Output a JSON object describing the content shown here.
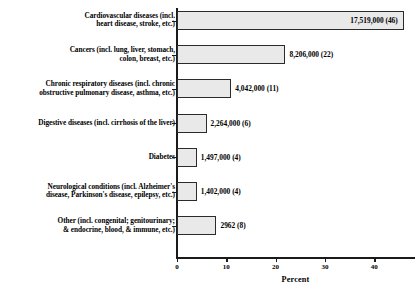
{
  "chart_data": {
    "type": "bar",
    "orientation": "horizontal",
    "title": "",
    "xlabel": "Percent",
    "ylabel": "",
    "xlim": [
      0,
      48.5
    ],
    "xticks": [
      0,
      10,
      20,
      30,
      40
    ],
    "xtick_labels": [
      "0",
      "10",
      "20",
      "30",
      "40"
    ],
    "grid": false,
    "legend": null,
    "categories": [
      "Cardiovascular diseases (incl. heart disease, stroke,  etc.)",
      "Cancers (incl. lung, liver, stomach, colon, breast, etc.)",
      "Chronic respiratory diseases (incl. chronic obstructive pulmonary disease, asthma, etc.)",
      "Digestive diseases (incl. cirrhosis of the liver)",
      "Diabetes",
      "Neurological conditions (incl. Alzheimer's disease, Parkinson's disease, epilepsy, etc.)",
      "Other (incl. congenital; genitourinary; & endocrine, blood, & immune, etc.)"
    ],
    "values": [
      46,
      22,
      11,
      6,
      4,
      4,
      8
    ],
    "counts": [
      17519000,
      8206000,
      4042000,
      2264000,
      1497000,
      1402000,
      2962
    ],
    "data_labels": [
      "17,519,000 (46)",
      "8,206,000 (22)",
      "4,042,000 (11)",
      "2,264,000 (6)",
      "1,497,000 (4)",
      "1,402,000 (4)",
      "2962 (8)"
    ]
  },
  "rows": [
    {
      "label_lines": [
        "Cardiovascular diseases (incl.",
        "heart disease, stroke,  etc.)"
      ],
      "value_label": "17,519,000 (46)",
      "percent": 46,
      "label_inside": true
    },
    {
      "label_lines": [
        "Cancers (incl. lung, liver, stomach,",
        "colon, breast, etc.)"
      ],
      "value_label": "8,206,000 (22)",
      "percent": 22,
      "label_inside": false
    },
    {
      "label_lines": [
        "Chronic respiratory diseases (incl. chronic",
        "obstructive pulmonary disease, asthma, etc.)"
      ],
      "value_label": "4,042,000 (11)",
      "percent": 11,
      "label_inside": false
    },
    {
      "label_lines": [
        "Digestive diseases (incl. cirrhosis of the liver)"
      ],
      "value_label": "2,264,000 (6)",
      "percent": 6,
      "label_inside": false
    },
    {
      "label_lines": [
        "Diabetes"
      ],
      "value_label": "1,497,000 (4)",
      "percent": 4,
      "label_inside": false
    },
    {
      "label_lines": [
        "Neurological conditions (incl. Alzheimer's",
        "disease, Parkinson's disease, epilepsy, etc.)"
      ],
      "value_label": "1,402,000 (4)",
      "percent": 4,
      "label_inside": false
    },
    {
      "label_lines": [
        "Other (incl. congenital; genitourinary;",
        "& endocrine, blood, & immune, etc.)"
      ],
      "value_label": "2962 (8)",
      "percent": 8,
      "label_inside": false
    }
  ],
  "axis": {
    "title": "Percent",
    "ticks": [
      "0",
      "10",
      "20",
      "30",
      "40"
    ]
  },
  "style": {
    "bar_fill": "#e9e9e9",
    "bar_border": "#2b2b2b",
    "axis_color": "#1a1a1a",
    "text_color": "#000000",
    "background": "#ffffff"
  }
}
